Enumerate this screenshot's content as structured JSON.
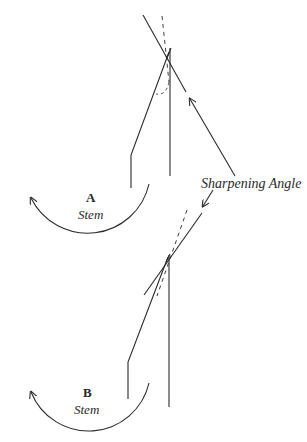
{
  "figure": {
    "type": "diagram",
    "panels": [
      {
        "label": "A",
        "caption": "Stem"
      },
      {
        "label": "B",
        "caption": "Stem"
      }
    ],
    "annotation": "Sharpening Angle",
    "colors": {
      "ink": "#2a2a2a",
      "background": "#ffffff"
    }
  }
}
